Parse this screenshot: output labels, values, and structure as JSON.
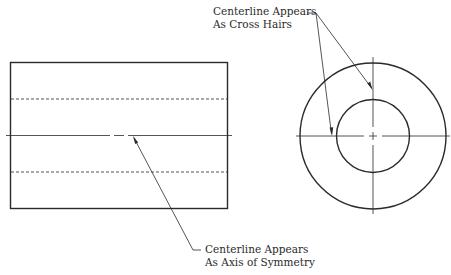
{
  "annotations": {
    "top": {
      "line1": "Centerline Appears",
      "line2": "As Cross Hairs"
    },
    "bottom": {
      "line1": "Centerline Appears",
      "line2": "As Axis of Symmetry"
    }
  },
  "views": {
    "front": "rectangular view with hidden lines and centerline",
    "end": "concentric circles with crossing centerlines"
  },
  "colors": {
    "stroke": "#2a2a2a",
    "background": "#ffffff"
  }
}
